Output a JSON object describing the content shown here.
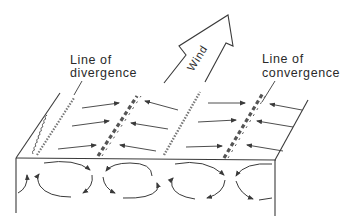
{
  "figure": {
    "type": "schematic-diagram"
  },
  "labels": {
    "divergence": [
      "Line of",
      "divergence"
    ],
    "convergence": [
      "Line of",
      "convergence"
    ],
    "wind": "Wind"
  },
  "colors": {
    "ink": "#3a3a3a",
    "background": "#ffffff"
  },
  "elements": {
    "wind_arrow": {
      "direction": "up-right"
    },
    "surface_lines": [
      {
        "kind": "divergence",
        "style": "squiggly"
      },
      {
        "kind": "convergence",
        "style": "dashed-hatched"
      },
      {
        "kind": "divergence",
        "style": "squiggly"
      },
      {
        "kind": "convergence",
        "style": "dashed-hatched"
      }
    ],
    "surface_arrow_rows": 3,
    "circulation_cells": [
      {
        "rotation": "counterclockwise-partial"
      },
      {
        "rotation": "clockwise"
      },
      {
        "rotation": "counterclockwise"
      },
      {
        "rotation": "clockwise"
      },
      {
        "rotation": "counterclockwise-partial"
      }
    ]
  }
}
